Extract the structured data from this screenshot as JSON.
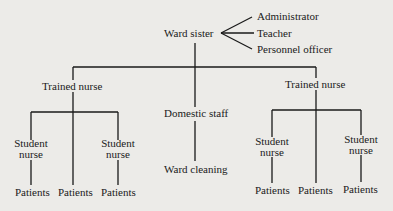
{
  "diagram": {
    "type": "organization-chart",
    "root": {
      "label": "Ward sister",
      "roles": [
        "Administrator",
        "Teacher",
        "Personnel officer"
      ]
    },
    "children": {
      "left_trained": "Trained nurse",
      "domestic": "Domestic staff",
      "domestic_task": "Ward cleaning",
      "right_trained": "Trained nurse"
    },
    "left_branch": {
      "student_a": [
        "Student",
        "nurse"
      ],
      "student_b": [
        "Student",
        "nurse"
      ],
      "patients": [
        "Patients",
        "Patients",
        "Patients"
      ]
    },
    "right_branch": {
      "student_a": [
        "Student",
        "nurse"
      ],
      "student_b": [
        "Student",
        "nurse"
      ],
      "patients": [
        "Patients",
        "Patients",
        "Patients"
      ]
    },
    "colors": {
      "background": "#ecebe8",
      "ink": "#1a1a1a"
    }
  }
}
